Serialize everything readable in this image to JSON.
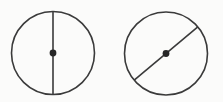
{
  "figure": {
    "name": "two-circles-with-diameter",
    "background_color": "#fbfbfa",
    "stroke_color": "#3a3a3a",
    "dot_color": "#262626",
    "width": 223,
    "height": 102,
    "stroke_width": 1.6,
    "description": "Two circles each drawn with a single diameter line passing through a marked center point. The left circle's diameter is vertical; the right circle's diameter is diagonal, rising from lower-left to upper-right.",
    "shapes": [
      {
        "id": "left-circle",
        "label": "Circle with vertical diameter",
        "center_x": 53,
        "center_y": 53,
        "radius": 41.5,
        "center_dot_radius": 3.4,
        "diameter": {
          "orientation": "vertical",
          "angle_degrees": 90,
          "x1": 53,
          "y1": 11.5,
          "x2": 53,
          "y2": 94.5
        }
      },
      {
        "id": "right-circle",
        "label": "Circle with diagonal diameter",
        "center_x": 166,
        "center_y": 53.5,
        "radius": 41.5,
        "center_dot_radius": 3.4,
        "diameter": {
          "orientation": "diagonal",
          "angle_degrees": 40,
          "x1": 134.2,
          "y1": 80.2,
          "x2": 197.8,
          "y2": 26.8
        }
      }
    ]
  }
}
